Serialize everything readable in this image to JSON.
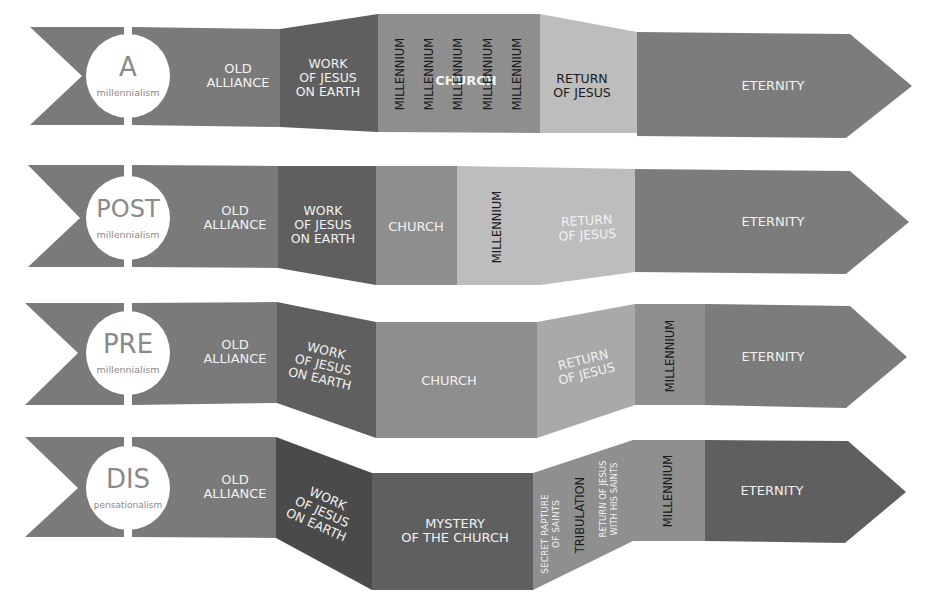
{
  "diagram": {
    "colors": {
      "background": "#ffffff",
      "old_alliance": "#7a7a7a",
      "work_dark": "#5f5f5f",
      "work_darker": "#4a4a4a",
      "church_mid": "#8e8e8e",
      "light": "#bdbdbd",
      "light2": "#a9a9a9",
      "eternity": "#7c7c7c",
      "millennium_band": "#8f8f8f",
      "text_light": "#f2f2f2",
      "text_dark": "#1a1a1a",
      "badge_bg": "#ffffff",
      "badge_text": "#8a8a8a"
    },
    "rows": [
      {
        "id": "a-millennialism",
        "badge": {
          "main": "A",
          "sub": "millennialism",
          "cx": 128,
          "cy": 76,
          "r": 42
        },
        "flag": {
          "points": "30,27 124,27 124,125 30,125 82,76"
        },
        "segments": [
          {
            "name": "old-alliance",
            "points": "132,27 280,29 280,127 132,125",
            "fill": "old_alliance",
            "lines": [
              "OLD",
              "ALLIANCE"
            ],
            "tx": 238,
            "ty": 76,
            "color": "text_light",
            "size": 13,
            "rotate": 0
          },
          {
            "name": "work-of-jesus",
            "points": "280,29 378,14 378,132 280,127",
            "fill": "work_dark",
            "lines": [
              "WORK",
              "OF JESUS",
              "ON EARTH"
            ],
            "tx": 328,
            "ty": 78,
            "color": "text_light",
            "size": 12.5,
            "rotate": 0
          },
          {
            "name": "church-millennium",
            "points": "378,14 540,14 540,133 378,132",
            "fill": "church_mid",
            "lines": [
              "CHURCH"
            ],
            "tx": 466,
            "ty": 81,
            "color": "text_light",
            "size": 13,
            "rotate": 0,
            "bold": true
          },
          {
            "name": "return-of-jesus",
            "points": "540,14 637,32 637,133 540,133",
            "fill": "light",
            "lines": [
              "RETURN",
              "OF JESUS"
            ],
            "tx": 582,
            "ty": 86,
            "color": "text_dark",
            "size": 12.5,
            "rotate": 0
          },
          {
            "name": "eternity",
            "points": "637,32 850,34 912,86 846,138 637,136",
            "fill": "eternity",
            "lines": [
              "ETERNITY"
            ],
            "tx": 773,
            "ty": 86,
            "color": "text_light",
            "size": 13,
            "rotate": 0
          }
        ],
        "vertical_labels": [
          {
            "text": "MILLENNIUM",
            "x": 400,
            "y": 74,
            "color": "text_dark",
            "size": 11.5
          },
          {
            "text": "MILLENNIUM",
            "x": 429,
            "y": 74,
            "color": "text_dark",
            "size": 11.5
          },
          {
            "text": "MILLENNIUM",
            "x": 458,
            "y": 74,
            "color": "text_dark",
            "size": 11.5
          },
          {
            "text": "MILLENNIUM",
            "x": 488,
            "y": 74,
            "color": "text_dark",
            "size": 11.5
          },
          {
            "text": "MILLENNIUM",
            "x": 517,
            "y": 74,
            "color": "text_dark",
            "size": 11.5
          }
        ]
      },
      {
        "id": "post-millennialism",
        "badge": {
          "main": "POST",
          "sub": "millennialism",
          "cx": 128,
          "cy": 218,
          "r": 42
        },
        "flag": {
          "points": "28,165 124,165 124,267 28,267 80,218"
        },
        "segments": [
          {
            "name": "old-alliance",
            "points": "132,165 278,166 278,268 132,267",
            "fill": "old_alliance",
            "lines": [
              "OLD",
              "ALLIANCE"
            ],
            "tx": 235,
            "ty": 218,
            "color": "text_light",
            "size": 13,
            "rotate": 0
          },
          {
            "name": "work-of-jesus",
            "points": "278,166 376,166 376,285 278,268",
            "fill": "work_dark",
            "lines": [
              "WORK",
              "OF JESUS",
              "ON EARTH"
            ],
            "tx": 323,
            "ty": 225,
            "color": "text_light",
            "size": 12.5,
            "rotate": 0
          },
          {
            "name": "church",
            "points": "376,166 457,166 457,285 376,285",
            "fill": "church_mid",
            "lines": [
              "CHURCH"
            ],
            "tx": 416,
            "ty": 227,
            "color": "text_light",
            "size": 13,
            "rotate": 0
          },
          {
            "name": "millennium-return",
            "points": "457,166 635,169 635,272 540,285 457,285",
            "fill": "light",
            "lines": [
              "RETURN",
              "OF JESUS"
            ],
            "tx": 587,
            "ty": 228,
            "color": "text_light",
            "size": 12.5,
            "rotate": -3
          },
          {
            "name": "eternity",
            "points": "635,169 850,171 909,222 846,274 635,272",
            "fill": "eternity",
            "lines": [
              "ETERNITY"
            ],
            "tx": 773,
            "ty": 222,
            "color": "text_light",
            "size": 13,
            "rotate": 0
          }
        ],
        "vertical_labels": [
          {
            "text": "MILLENNIUM",
            "x": 497,
            "y": 227,
            "color": "text_dark",
            "size": 11.5
          }
        ]
      },
      {
        "id": "pre-millennialism",
        "badge": {
          "main": "PRE",
          "sub": "millennialism",
          "cx": 128,
          "cy": 353,
          "r": 42
        },
        "flag": {
          "points": "25,303 124,303 124,405 25,405 78,353"
        },
        "segments": [
          {
            "name": "old-alliance",
            "points": "132,303 277,302 277,403 132,405",
            "fill": "old_alliance",
            "lines": [
              "OLD",
              "ALLIANCE"
            ],
            "tx": 235,
            "ty": 352,
            "color": "text_light",
            "size": 13,
            "rotate": 0
          },
          {
            "name": "work-of-jesus",
            "points": "277,302 376,322 376,438 277,403",
            "fill": "work_dark",
            "lines": [
              "WORK",
              "OF JESUS",
              "ON EARTH"
            ],
            "tx": 323,
            "ty": 365,
            "color": "text_light",
            "size": 12.5,
            "rotate": 13
          },
          {
            "name": "church",
            "points": "376,322 537,322 537,438 376,438",
            "fill": "church_mid",
            "lines": [
              "CHURCH"
            ],
            "tx": 449,
            "ty": 381,
            "color": "text_light",
            "size": 13,
            "rotate": 0
          },
          {
            "name": "return-of-jesus",
            "points": "537,322 635,304 635,405 537,438",
            "fill": "light2",
            "lines": [
              "RETURN",
              "OF JESUS"
            ],
            "tx": 585,
            "ty": 367,
            "color": "text_light",
            "size": 12.5,
            "rotate": -14
          },
          {
            "name": "millennium",
            "points": "635,304 705,304 705,405 635,405",
            "fill": "millennium_band",
            "lines": [],
            "tx": 0,
            "ty": 0,
            "color": "text_dark",
            "size": 12,
            "rotate": 0
          },
          {
            "name": "eternity",
            "points": "705,304 850,306 907,357 846,408 705,405",
            "fill": "eternity",
            "lines": [
              "ETERNITY"
            ],
            "tx": 773,
            "ty": 357,
            "color": "text_light",
            "size": 13,
            "rotate": 0
          }
        ],
        "vertical_labels": [
          {
            "text": "MILLENNIUM",
            "x": 670,
            "y": 356,
            "color": "text_dark",
            "size": 11.5
          }
        ]
      },
      {
        "id": "dis-pensationalism",
        "badge": {
          "main": "DIS",
          "sub": "pensationalism",
          "cx": 128,
          "cy": 488,
          "r": 42
        },
        "flag": {
          "points": "25,437 124,437 124,537 25,537 78,488"
        },
        "segments": [
          {
            "name": "old-alliance",
            "points": "132,437 276,437 276,538 132,537",
            "fill": "old_alliance",
            "lines": [
              "OLD",
              "ALLIANCE"
            ],
            "tx": 235,
            "ty": 487,
            "color": "text_light",
            "size": 13,
            "rotate": 0
          },
          {
            "name": "work-of-jesus",
            "points": "276,437 372,473 372,590 276,538",
            "fill": "work_darker",
            "lines": [
              "WORK",
              "OF JESUS",
              "ON EARTH"
            ],
            "tx": 322,
            "ty": 512,
            "color": "text_light",
            "size": 12.5,
            "rotate": 24
          },
          {
            "name": "mystery-of-the-church",
            "points": "372,473 533,473 533,590 372,590",
            "fill": "work_dark",
            "lines": [
              "MYSTERY",
              "OF THE CHURCH"
            ],
            "tx": 455,
            "ty": 531,
            "color": "text_light",
            "size": 13,
            "rotate": 0
          },
          {
            "name": "rapture-tribulation-return",
            "points": "533,473 633,440 633,541 533,590",
            "fill": "millennium_band",
            "lines": [],
            "tx": 0,
            "ty": 0,
            "color": "text_light",
            "size": 12,
            "rotate": 0
          },
          {
            "name": "millennium",
            "points": "633,440 705,440 705,541 633,541",
            "fill": "millennium_band",
            "lines": [],
            "tx": 0,
            "ty": 0,
            "color": "text_dark",
            "size": 12,
            "rotate": 0
          },
          {
            "name": "eternity",
            "points": "705,440 848,441 906,492 845,543 705,541",
            "fill": "work_dark",
            "lines": [
              "ETERNITY"
            ],
            "tx": 772,
            "ty": 491,
            "color": "text_light",
            "size": 13,
            "rotate": 0
          }
        ],
        "vertical_labels": [
          {
            "text": "SECRET RAPTURE",
            "x": 545,
            "y": 534,
            "color": "text_light",
            "size": 9
          },
          {
            "text": "OF SAINTS",
            "x": 556,
            "y": 524,
            "color": "text_light",
            "size": 9
          },
          {
            "text": "TRIBULATION",
            "x": 580,
            "y": 515,
            "color": "text_dark",
            "size": 11.5
          },
          {
            "text": "RETURN OF JESUS",
            "x": 603,
            "y": 499,
            "color": "text_light",
            "size": 8.5
          },
          {
            "text": "WITH HIS SAINTS",
            "x": 614,
            "y": 499,
            "color": "text_light",
            "size": 8.5
          },
          {
            "text": "MILLENNIUM",
            "x": 668,
            "y": 491,
            "color": "text_dark",
            "size": 11.5
          }
        ]
      }
    ]
  }
}
